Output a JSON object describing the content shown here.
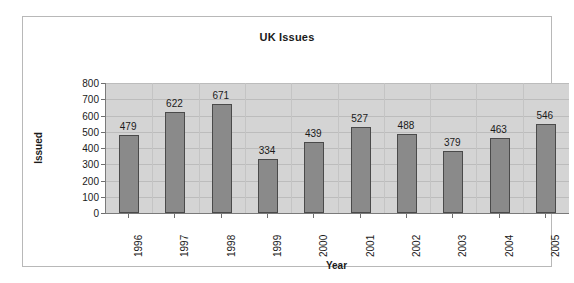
{
  "chart_data": {
    "type": "bar",
    "title": "UK Issues",
    "xlabel": "Year",
    "ylabel": "Issued",
    "categories": [
      "1996",
      "1997",
      "1998",
      "1999",
      "2000",
      "2001",
      "2002",
      "2003",
      "2004",
      "2005"
    ],
    "values": [
      479,
      622,
      671,
      334,
      439,
      527,
      488,
      379,
      463,
      546
    ],
    "value_labels": [
      "479",
      "622",
      "671",
      "334",
      "439",
      "527",
      "488",
      "379",
      "463",
      "546"
    ],
    "ylim": [
      0,
      800
    ],
    "ytick_values": [
      0,
      100,
      200,
      300,
      400,
      500,
      600,
      700,
      800
    ],
    "ytick_labels": [
      "0",
      "100",
      "200",
      "300",
      "400",
      "500",
      "600",
      "700",
      "800"
    ],
    "grid": true,
    "grid_axis": "y",
    "legend": false,
    "legend_position": "none",
    "data_labels": true,
    "series": [
      {
        "name": "Issued",
        "values": [
          479,
          622,
          671,
          334,
          439,
          527,
          488,
          379,
          463,
          546
        ]
      }
    ],
    "colors": {
      "bar_fill": "#8a8a8a",
      "bar_border": "#4a4a4a",
      "plot_background": "#d4d4d4",
      "gridline": "#bcbcbc",
      "axis_line": "#7a7a7a",
      "text": "#1a1a1a",
      "frame_border": "#b8b8b8",
      "page_background": "#ffffff"
    }
  }
}
